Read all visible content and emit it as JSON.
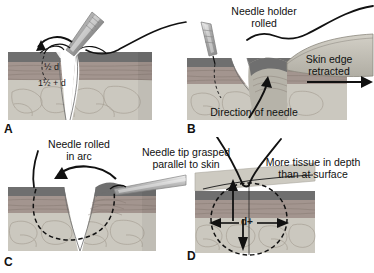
{
  "figure": {
    "type": "medical-illustration",
    "panel_count": 4,
    "colors": {
      "epidermis": "#6f6f6f",
      "dermis": "#9a8f8f",
      "dermis_mid": "#a89b99",
      "subcutaneous": "#c9c6bd",
      "block_side": "#b9b6ad",
      "instrument": "#b0b0b0",
      "ink": "#111111",
      "background": "#ffffff"
    }
  },
  "panels": [
    {
      "id": "A",
      "letter": "A",
      "position": "top-left",
      "labels": [
        {
          "name": "half-d",
          "text": "½ d"
        },
        {
          "name": "one-half-plus-d",
          "text": "1½ + d"
        }
      ],
      "elements": [
        "needle-holder",
        "curved-needle",
        "rotation-arrow",
        "wound-cleft",
        "tissue-block"
      ]
    },
    {
      "id": "B",
      "letter": "B",
      "position": "top-right",
      "labels": [
        {
          "name": "needle-holder-rolled",
          "text": "Needle holder\nrolled"
        },
        {
          "name": "skin-edge-retracted",
          "text": "Skin edge\nretracted"
        },
        {
          "name": "direction-of-needle",
          "text": "Direction of needle"
        }
      ],
      "elements": [
        "needle-holder",
        "suture-thread",
        "retraction-arrow",
        "direction-arrow",
        "retracted-skin-flap",
        "tissue-block"
      ]
    },
    {
      "id": "C",
      "letter": "C",
      "position": "bottom-left",
      "labels": [
        {
          "name": "needle-rolled-in-arc",
          "text": "Needle rolled\nin arc"
        },
        {
          "name": "needle-tip-grasped",
          "text": "Needle tip grasped\nparallel to skin"
        }
      ],
      "elements": [
        "suture-thread",
        "dashed-needle-path",
        "rotation-arrow",
        "forceps",
        "wound-cleft",
        "tissue-block"
      ]
    },
    {
      "id": "D",
      "letter": "D",
      "position": "bottom-right",
      "labels": [
        {
          "name": "more-tissue-in-depth",
          "text": "More tissue in depth\nthan at surface"
        },
        {
          "name": "d-plus",
          "text": "d+"
        }
      ],
      "elements": [
        "suture-loop",
        "dashed-circle-path",
        "vertical-depth-arrow",
        "horizontal-width-arrow",
        "tissue-block"
      ]
    }
  ]
}
